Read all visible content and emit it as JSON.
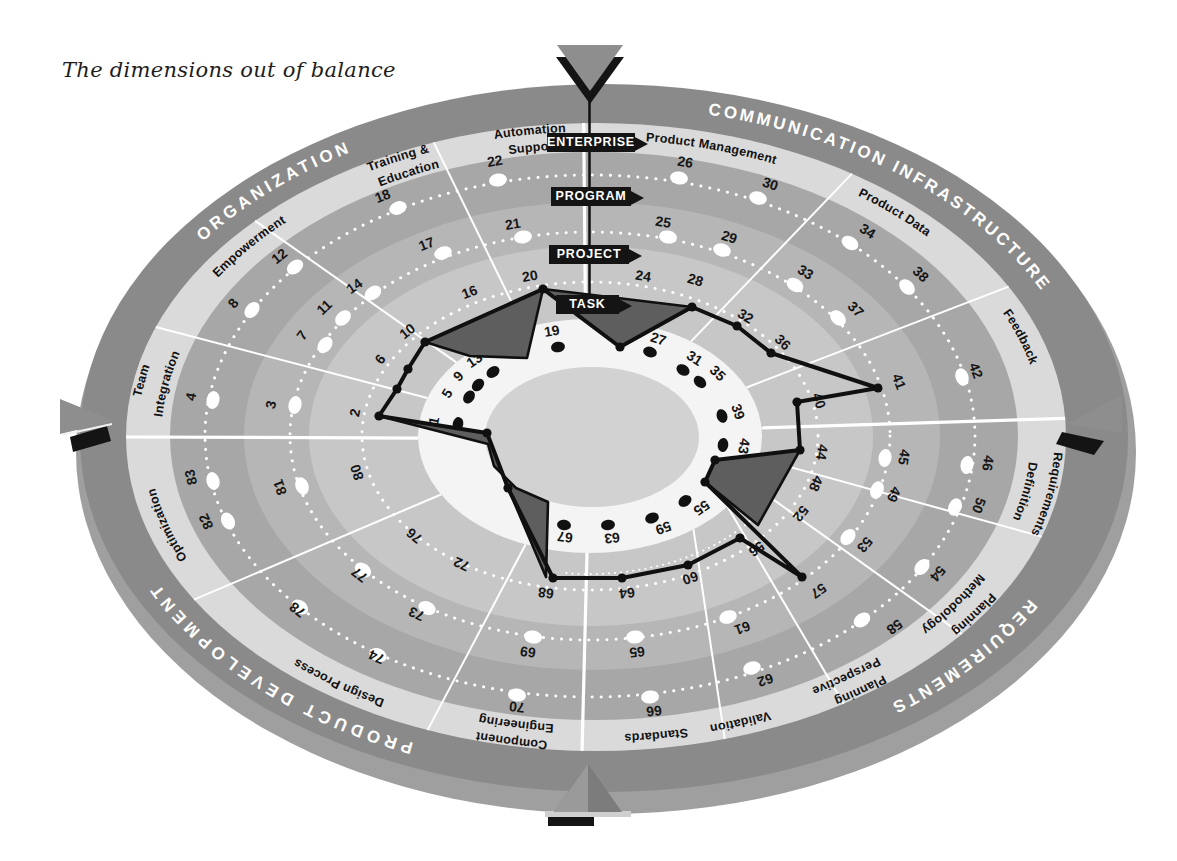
{
  "title": "The dimensions out of balance",
  "diagram": {
    "levels": [
      "ENTERPRISE",
      "PROGRAM",
      "PROJECT",
      "TASK"
    ],
    "categories": [
      {
        "label": "ORGANIZATION",
        "t1": 146,
        "t2": 118,
        "ls": 4
      },
      {
        "label": "COMMUNICATION INFRASTRUCTURE",
        "t1": 84,
        "t2": 17,
        "ls": 3
      },
      {
        "label": "REQUIREMENTS",
        "t1": -28.5,
        "t2": -55,
        "ls": 3.5
      },
      {
        "label": "PRODUCT DEVELOPMENT",
        "t1": -108.5,
        "t2": -159,
        "ls": 5
      }
    ],
    "dimensions": [
      {
        "slug": "team-integration",
        "lines": [
          "Team",
          "Integration"
        ],
        "t": 171.9
      },
      {
        "slug": "empowerment",
        "lines": [
          "Empowerment"
        ],
        "t": 147
      },
      {
        "slug": "training-education",
        "lines": [
          "Training &",
          "Education"
        ],
        "t": 120.3
      },
      {
        "slug": "automation-support",
        "lines": [
          "Automation",
          "Support"
        ],
        "t": 100
      },
      {
        "slug": "product-management",
        "lines": [
          "Product Management"
        ],
        "t": 72
      },
      {
        "slug": "product-data",
        "lines": [
          "Product Data"
        ],
        "t": 41.9
      },
      {
        "slug": "feedback",
        "lines": [
          "Feedback"
        ],
        "t": 15.2
      },
      {
        "slug": "requirements-definition",
        "lines": [
          "Requirements",
          "Definition"
        ],
        "t": -8.3
      },
      {
        "slug": "planning-methodology",
        "lines": [
          "Planning",
          "Methodology"
        ],
        "t": -28.8
      },
      {
        "slug": "planning-perspective",
        "lines": [
          "Planning",
          "Perspective"
        ],
        "t": -49
      },
      {
        "slug": "validation",
        "lines": [
          "Validation"
        ],
        "t": -67.5
      },
      {
        "slug": "standards",
        "lines": [
          "Standards"
        ],
        "t": -80.7
      },
      {
        "slug": "component-engineering",
        "lines": [
          "Component",
          "Engineering"
        ],
        "t": -102.8
      },
      {
        "slug": "design-process",
        "lines": [
          "Design Process"
        ],
        "t": -131
      },
      {
        "slug": "optimization",
        "lines": [
          "Optimization"
        ],
        "t": -166.7
      }
    ],
    "numbers": [
      {
        "n": "1",
        "x": 435,
        "y": 421
      },
      {
        "n": "2",
        "x": 356,
        "y": 413
      },
      {
        "n": "3",
        "x": 272,
        "y": 405
      },
      {
        "n": "4",
        "x": 192,
        "y": 397
      },
      {
        "n": "5",
        "x": 448,
        "y": 394
      },
      {
        "n": "6",
        "x": 381,
        "y": 360
      },
      {
        "n": "7",
        "x": 303,
        "y": 336
      },
      {
        "n": "8",
        "x": 234,
        "y": 304
      },
      {
        "n": "9",
        "x": 459,
        "y": 377
      },
      {
        "n": "10",
        "x": 408,
        "y": 332
      },
      {
        "n": "11",
        "x": 325,
        "y": 308
      },
      {
        "n": "12",
        "x": 280,
        "y": 257
      },
      {
        "n": "13",
        "x": 475,
        "y": 361
      },
      {
        "n": "14",
        "x": 355,
        "y": 287
      },
      {
        "n": "16",
        "x": 470,
        "y": 293
      },
      {
        "n": "17",
        "x": 427,
        "y": 245
      },
      {
        "n": "18",
        "x": 383,
        "y": 197
      },
      {
        "n": "19",
        "x": 552,
        "y": 332
      },
      {
        "n": "20",
        "x": 530,
        "y": 277
      },
      {
        "n": "21",
        "x": 513,
        "y": 225
      },
      {
        "n": "22",
        "x": 495,
        "y": 162
      },
      {
        "n": "24",
        "x": 643,
        "y": 277
      },
      {
        "n": "25",
        "x": 663,
        "y": 223
      },
      {
        "n": "26",
        "x": 685,
        "y": 163
      },
      {
        "n": "27",
        "x": 658,
        "y": 340
      },
      {
        "n": "28",
        "x": 695,
        "y": 281
      },
      {
        "n": "29",
        "x": 729,
        "y": 238
      },
      {
        "n": "30",
        "x": 770,
        "y": 185
      },
      {
        "n": "31",
        "x": 694,
        "y": 359
      },
      {
        "n": "32",
        "x": 745,
        "y": 317
      },
      {
        "n": "33",
        "x": 805,
        "y": 273
      },
      {
        "n": "34",
        "x": 867,
        "y": 232
      },
      {
        "n": "35",
        "x": 717,
        "y": 374
      },
      {
        "n": "36",
        "x": 782,
        "y": 343
      },
      {
        "n": "37",
        "x": 855,
        "y": 310
      },
      {
        "n": "38",
        "x": 920,
        "y": 275
      },
      {
        "n": "39",
        "x": 737,
        "y": 412
      },
      {
        "n": "40",
        "x": 818,
        "y": 401
      },
      {
        "n": "41",
        "x": 898,
        "y": 382
      },
      {
        "n": "42",
        "x": 975,
        "y": 371
      },
      {
        "n": "43",
        "x": 743,
        "y": 446
      },
      {
        "n": "44",
        "x": 821,
        "y": 452
      },
      {
        "n": "45",
        "x": 903,
        "y": 457
      },
      {
        "n": "46",
        "x": 987,
        "y": 463
      },
      {
        "n": "48",
        "x": 815,
        "y": 483
      },
      {
        "n": "49",
        "x": 893,
        "y": 494
      },
      {
        "n": "50",
        "x": 978,
        "y": 505
      },
      {
        "n": "52",
        "x": 800,
        "y": 513
      },
      {
        "n": "53",
        "x": 864,
        "y": 544
      },
      {
        "n": "54",
        "x": 937,
        "y": 573
      },
      {
        "n": "55",
        "x": 701,
        "y": 507
      },
      {
        "n": "56",
        "x": 756,
        "y": 548
      },
      {
        "n": "57",
        "x": 818,
        "y": 590
      },
      {
        "n": "58",
        "x": 894,
        "y": 626
      },
      {
        "n": "59",
        "x": 663,
        "y": 527
      },
      {
        "n": "60",
        "x": 690,
        "y": 577
      },
      {
        "n": "61",
        "x": 742,
        "y": 627
      },
      {
        "n": "62",
        "x": 765,
        "y": 679
      },
      {
        "n": "63",
        "x": 612,
        "y": 537
      },
      {
        "n": "64",
        "x": 627,
        "y": 592
      },
      {
        "n": "65",
        "x": 637,
        "y": 651
      },
      {
        "n": "66",
        "x": 654,
        "y": 710
      },
      {
        "n": "67",
        "x": 565,
        "y": 536
      },
      {
        "n": "68",
        "x": 546,
        "y": 592
      },
      {
        "n": "69",
        "x": 528,
        "y": 651
      },
      {
        "n": "70",
        "x": 517,
        "y": 706
      },
      {
        "n": "72",
        "x": 462,
        "y": 563
      },
      {
        "n": "73",
        "x": 417,
        "y": 613
      },
      {
        "n": "74",
        "x": 377,
        "y": 656
      },
      {
        "n": "76",
        "x": 415,
        "y": 535
      },
      {
        "n": "77",
        "x": 360,
        "y": 574
      },
      {
        "n": "78",
        "x": 298,
        "y": 609
      },
      {
        "n": "80",
        "x": 358,
        "y": 472
      },
      {
        "n": "81",
        "x": 281,
        "y": 487
      },
      {
        "n": "82",
        "x": 207,
        "y": 521
      },
      {
        "n": "83",
        "x": 192,
        "y": 477
      }
    ],
    "white_dots": [
      [
        213,
        400
      ],
      [
        295,
        405
      ],
      [
        325,
        345
      ],
      [
        252,
        310
      ],
      [
        343,
        318
      ],
      [
        295,
        267
      ],
      [
        373,
        293
      ],
      [
        443,
        253
      ],
      [
        398,
        208
      ],
      [
        523,
        237
      ],
      [
        498,
        180
      ],
      [
        679,
        178
      ],
      [
        668,
        237
      ],
      [
        758,
        198
      ],
      [
        722,
        250
      ],
      [
        850,
        243
      ],
      [
        795,
        285
      ],
      [
        838,
        318
      ],
      [
        907,
        287
      ],
      [
        962,
        377
      ],
      [
        885,
        458
      ],
      [
        967,
        465
      ],
      [
        877,
        490
      ],
      [
        955,
        507
      ],
      [
        848,
        537
      ],
      [
        922,
        567
      ],
      [
        862,
        620
      ],
      [
        728,
        617
      ],
      [
        752,
        668
      ],
      [
        635,
        637
      ],
      [
        650,
        697
      ],
      [
        533,
        637
      ],
      [
        517,
        695
      ],
      [
        427,
        608
      ],
      [
        378,
        655
      ],
      [
        363,
        570
      ],
      [
        300,
        607
      ],
      [
        213,
        481
      ],
      [
        302,
        486
      ],
      [
        228,
        521
      ]
    ],
    "task_dots": [
      [
        458,
        424
      ],
      [
        469,
        397
      ],
      [
        478,
        385
      ],
      [
        493,
        372
      ],
      [
        558,
        347
      ],
      [
        650,
        352
      ],
      [
        683,
        370
      ],
      [
        700,
        382
      ],
      [
        722,
        416
      ],
      [
        723,
        445
      ],
      [
        685,
        501
      ],
      [
        652,
        518
      ],
      [
        608,
        525
      ],
      [
        564,
        525
      ]
    ],
    "profile": {
      "outline": [
        [
          379,
          416
        ],
        [
          397,
          389
        ],
        [
          408,
          369
        ],
        [
          425,
          342
        ],
        [
          543,
          289
        ],
        [
          620,
          347
        ],
        [
          692,
          307
        ],
        [
          737,
          326
        ],
        [
          771,
          353
        ],
        [
          878,
          388
        ],
        [
          797,
          402
        ],
        [
          800,
          450
        ],
        [
          715,
          460
        ],
        [
          705,
          482
        ],
        [
          802,
          577
        ],
        [
          740,
          538
        ],
        [
          688,
          565
        ],
        [
          622,
          578
        ],
        [
          553,
          578
        ],
        [
          508,
          488
        ],
        [
          487,
          433
        ]
      ],
      "wedges": [
        [
          [
            425,
            342
          ],
          [
            543,
            289
          ],
          [
            527,
            358
          ],
          [
            470,
            356
          ]
        ],
        [
          [
            543,
            289
          ],
          [
            692,
            307
          ],
          [
            620,
            347
          ]
        ],
        [
          [
            800,
            450
          ],
          [
            715,
            460
          ],
          [
            705,
            482
          ],
          [
            758,
            525
          ]
        ],
        [
          [
            379,
            416
          ],
          [
            487,
            433
          ],
          [
            508,
            488
          ],
          [
            546,
            577
          ],
          [
            548,
            502
          ],
          [
            516,
            488
          ],
          [
            494,
            466
          ],
          [
            488,
            444
          ]
        ]
      ]
    },
    "dividers": [
      {
        "to": 159.5,
        "ti": 161
      },
      {
        "to": 136.5,
        "ti": 141
      },
      {
        "to": 110.2,
        "ti": 112.5
      },
      {
        "to": 91.5,
        "ti": 91.5,
        "thick": true
      },
      {
        "to": 57,
        "ti": 54
      },
      {
        "to": 28.6,
        "ti": 24.5
      },
      {
        "to": 3.4,
        "ti": 4,
        "thick": true
      },
      {
        "to": -18.5,
        "ti": -11
      },
      {
        "to": -38.9,
        "ti": -23
      },
      {
        "to": -58.2,
        "ti": -37
      },
      {
        "to": -74.1,
        "ti": -53
      },
      {
        "to": -91.7,
        "ti": -91,
        "thick": true
      },
      {
        "to": -111,
        "ti": -112
      },
      {
        "to": -148.8,
        "ti": -150
      },
      {
        "to": 180,
        "ti": 181,
        "thick": true
      }
    ],
    "arrows": [
      "top",
      "right",
      "bottom",
      "left"
    ],
    "colors": {
      "rim": "#9f9f9f",
      "category_ring": "#8a8a8a",
      "sublabel_band": "#dadada",
      "enterprise_ring": "#a7a7a7",
      "program_ring": "#b6b6b6",
      "project_ring": "#c7c7c7",
      "task_band": "#f4f4f4",
      "hole": "#d2d2d2",
      "wedge": "#5e5e5e",
      "line": "#101010",
      "banner": "#141414",
      "banner_text": "#ffffff",
      "category_text": "#ffffff",
      "number_text": "#161616"
    }
  }
}
